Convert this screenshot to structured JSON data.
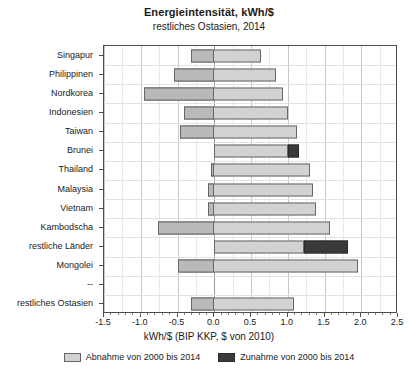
{
  "chart_data": {
    "type": "bar",
    "title": "Energieintensität, kWh/$",
    "subtitle": "restliches Ostasien, 2014",
    "xlabel": "kWh/$ (BIP KKP, $ von 2010)",
    "ylabel": "",
    "orientation": "horizontal",
    "stacked": true,
    "grid": true,
    "legend_position": "bottom",
    "xlim": [
      -1.5,
      2.5
    ],
    "xticks": [
      -1.5,
      -1.0,
      -0.5,
      0.0,
      0.5,
      1.0,
      1.5,
      2.0,
      2.5
    ],
    "xtick_labels": [
      "-1.5",
      "-1.0",
      "-0.5",
      "0.0",
      "0.5",
      "1.0",
      "1.5",
      "2.0",
      "2.5"
    ],
    "categories": [
      "Singapur",
      "Philippinen",
      "Nordkorea",
      "Indonesien",
      "Taiwan",
      "Brunei",
      "Thailand",
      "Malaysia",
      "Vietnam",
      "Kambodscha",
      "restliche Länder",
      "Mongolei",
      "--",
      "restliches Ostasien"
    ],
    "series": [
      {
        "name": "Abnahme von 2000 bis 2014",
        "color": "#d2d2d2",
        "start": [
          -0.31,
          -0.55,
          -0.96,
          -0.41,
          -0.46,
          0.0,
          -0.05,
          -0.08,
          -0.08,
          -0.77,
          0.0,
          -0.5,
          null,
          -0.31
        ],
        "end": [
          0.64,
          0.84,
          0.93,
          1.0,
          1.13,
          1.0,
          1.3,
          1.35,
          1.38,
          1.58,
          1.22,
          1.95,
          null,
          1.08
        ],
        "values": [
          0.95,
          1.39,
          1.89,
          1.41,
          1.59,
          1.0,
          1.35,
          1.43,
          1.46,
          2.35,
          1.22,
          2.45,
          null,
          1.39
        ]
      },
      {
        "name": "Zunahme von 2000 bis 2014",
        "color": "#3a3a3a",
        "start": [
          null,
          null,
          null,
          null,
          null,
          1.0,
          null,
          null,
          null,
          null,
          1.22,
          null,
          null,
          null
        ],
        "end": [
          null,
          null,
          null,
          null,
          null,
          1.15,
          null,
          null,
          null,
          null,
          1.82,
          null,
          null,
          null
        ],
        "values": [
          null,
          null,
          null,
          null,
          null,
          0.15,
          null,
          null,
          null,
          null,
          0.6,
          null,
          null,
          null
        ]
      }
    ]
  },
  "legend": {
    "items": [
      {
        "label": "Abnahme von 2000 bis 2014",
        "color": "#d2d2d2"
      },
      {
        "label": "Zunahme von 2000 bis 2014",
        "color": "#3a3a3a"
      }
    ]
  }
}
